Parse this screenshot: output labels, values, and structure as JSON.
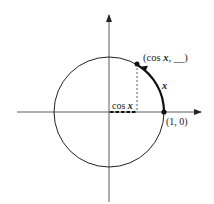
{
  "diagram": {
    "type": "unit-circle",
    "labels": {
      "point_label": "(cos x, __)",
      "point_label_prefix": "(cos ",
      "point_label_var": "x",
      "point_label_suffix": ", __)",
      "arc_label": "x",
      "cos_label_prefix": "cos ",
      "cos_label_var": "x",
      "one_zero_label": "(1, 0)"
    },
    "colors": {
      "stroke": "#222222",
      "background": "#ffffff"
    }
  }
}
